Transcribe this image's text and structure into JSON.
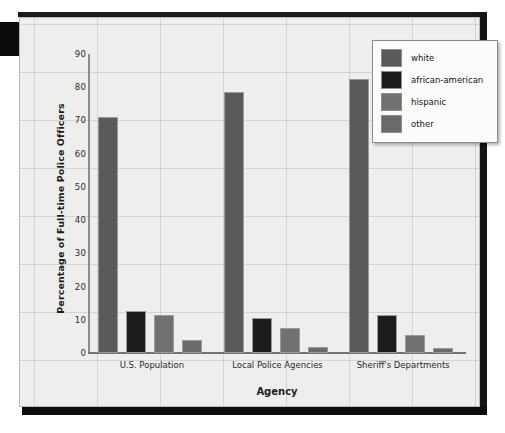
{
  "chart_data": {
    "type": "bar",
    "title": "",
    "xlabel": "Agency",
    "ylabel": "Percentage of Full-time Police Officers",
    "categories": [
      "U.S. Population",
      "Local Police Agencies",
      "Sheriff's Departments"
    ],
    "series": [
      {
        "name": "white",
        "color": "#5a5a5a",
        "values": [
          71,
          78.5,
          82.5
        ]
      },
      {
        "name": "african-american",
        "color": "#1c1c1c",
        "values": [
          12.5,
          10.5,
          11.5
        ]
      },
      {
        "name": "hispanic",
        "color": "#717171",
        "values": [
          11.5,
          7.5,
          5.5
        ]
      },
      {
        "name": "other",
        "color": "#6b6b6b",
        "values": [
          4,
          1.8,
          1.5
        ]
      }
    ],
    "ylim": [
      0,
      90
    ],
    "yticks": [
      0,
      10,
      20,
      30,
      40,
      50,
      60,
      70,
      80,
      90
    ],
    "ytick_labels": [
      "0",
      "10",
      "20",
      "30",
      "40",
      "50",
      "60",
      "70",
      "80",
      "90"
    ],
    "grid": true,
    "legend_position": "top-right",
    "legend_entries": [
      "white",
      "african-american",
      "hispanic",
      "other"
    ]
  },
  "figure": {
    "background_color": "#eeeeec",
    "axis_color": "#8a8d92",
    "grid_color": "#8c9196"
  }
}
